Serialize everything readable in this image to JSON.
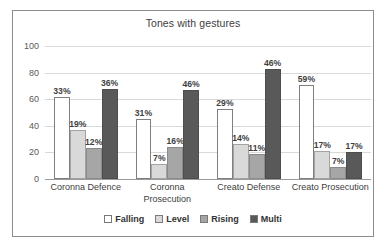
{
  "chart_data": {
    "type": "bar",
    "title": "Tones with gestures",
    "xlabel": "",
    "ylabel": "",
    "ylim": [
      0,
      100
    ],
    "yticks": [
      100,
      80,
      60,
      40,
      20,
      0
    ],
    "grid": true,
    "legend_position": "bottom",
    "categories": [
      "Coronna Defence",
      "Coronna Prosecution",
      "Creato Defense",
      "Creato Prosecution"
    ],
    "series": [
      {
        "name": "Falling",
        "color": "#FFFFFF",
        "values": [
          62,
          45,
          53,
          71
        ],
        "labels": [
          "33%",
          "31%",
          "29%",
          "59%"
        ]
      },
      {
        "name": "Level",
        "color": "#D9D9D9",
        "values": [
          37,
          11,
          26,
          21
        ],
        "labels": [
          "19%",
          "7%",
          "14%",
          "17%"
        ]
      },
      {
        "name": "Rising",
        "color": "#A6A6A6",
        "values": [
          23,
          24,
          19,
          9
        ],
        "labels": [
          "12%",
          "16%",
          "11%",
          "7%"
        ]
      },
      {
        "name": "Multi",
        "color": "#595959",
        "values": [
          68,
          67,
          83,
          20
        ],
        "labels": [
          "36%",
          "46%",
          "46%",
          "17%"
        ]
      }
    ]
  }
}
